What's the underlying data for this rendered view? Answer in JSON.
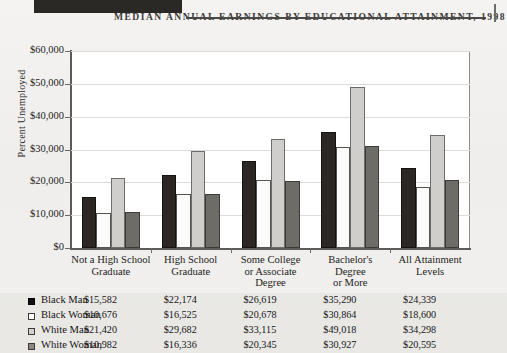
{
  "banner": {
    "ghost_text": ""
  },
  "header": {
    "title": "Median Annual Earnings by Educational Attainment, 1998"
  },
  "axis": {
    "y_title": "Percent Unemployed",
    "y_ticks": [
      "$60,000",
      "$50,000",
      "$40,000",
      "$30,000",
      "$20,000",
      "$10,000",
      "$0"
    ]
  },
  "chart_data": {
    "type": "bar",
    "title": "Median Annual Earnings by Educational Attainment, 1998",
    "xlabel": "",
    "ylabel": "Percent Unemployed",
    "ylim": [
      0,
      60000
    ],
    "ytick_values": [
      0,
      10000,
      20000,
      30000,
      40000,
      50000,
      60000
    ],
    "grid": true,
    "legend_position": "bottom-table",
    "categories": [
      "Not a High School Graduate",
      "High School Graduate",
      "Some College or Associate Degree",
      "Bachelor's Degree or More",
      "All Attainment Levels"
    ],
    "category_lines": [
      [
        "Not a High School",
        "Graduate"
      ],
      [
        "High School",
        "Graduate"
      ],
      [
        "Some College",
        "or Associate",
        "Degree"
      ],
      [
        "Bachelor's",
        "Degree",
        "or More"
      ],
      [
        "All Attainment",
        "Levels"
      ]
    ],
    "series": [
      {
        "name": "Black Man",
        "color": "#2a2724",
        "values": [
          15582,
          22174,
          26619,
          35290,
          24339
        ],
        "labels": [
          "$15,582",
          "$22,174",
          "$26,619",
          "$35,290",
          "$24,339"
        ]
      },
      {
        "name": "Black Woman",
        "color": "#fbfbfb",
        "values": [
          10676,
          16525,
          20678,
          30864,
          18600
        ],
        "labels": [
          "$10,676",
          "$16,525",
          "$20,678",
          "$30,864",
          "$18,600"
        ]
      },
      {
        "name": "White Man",
        "color": "#cfcecc",
        "values": [
          21420,
          29682,
          33115,
          49018,
          34298
        ],
        "labels": [
          "$21,420",
          "$29,682",
          "$33,115",
          "$49,018",
          "$34,298"
        ]
      },
      {
        "name": "White Woman",
        "color": "#6e6c69",
        "values": [
          10982,
          16336,
          20345,
          30927,
          20595
        ],
        "labels": [
          "$10,982",
          "$16,336",
          "$20,345",
          "$30,927",
          "$20,595"
        ]
      }
    ]
  }
}
